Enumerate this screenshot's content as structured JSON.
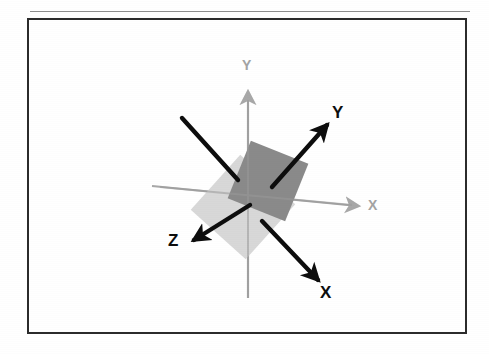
{
  "figure": {
    "kind": "technical-line-diagram",
    "caption": "",
    "background_color": "#ffffff",
    "frame": {
      "border_color": "#2b2b2b",
      "border_width_px": 2,
      "x": 27,
      "y": 18,
      "width": 440,
      "height": 316,
      "scan_rule_above": true
    },
    "origin": {
      "x": 248,
      "y": 205
    },
    "planes": [
      {
        "name": "original-plane",
        "fill_color": "#d8d8d8",
        "center_x": 243,
        "center_y": 207,
        "size": 74,
        "rotation_deg": 42
      },
      {
        "name": "rotated-plane",
        "fill_color": "#8a8a8a",
        "center_x": 268,
        "center_y": 181,
        "size": 62,
        "rotation_deg": 22
      }
    ],
    "axes_original": {
      "color": "#a8a8a8",
      "stroke_width": 2,
      "items": [
        {
          "name": "original-axis-y",
          "label": "Y",
          "direction": "up",
          "tip_x": 248,
          "tip_y": 92,
          "tail_x": 248,
          "tail_y": 298,
          "label_x": 243,
          "label_y": 62
        },
        {
          "name": "original-axis-x",
          "label": "X",
          "direction": "right",
          "tip_x": 360,
          "tip_y": 206,
          "tail_x": 152,
          "tail_y": 186,
          "label_x": 371,
          "label_y": 200
        }
      ]
    },
    "axes_rotated": {
      "color": "#0d0d0d",
      "stroke_width": 4,
      "items": [
        {
          "name": "rotated-axis-y",
          "label": "Y",
          "direction": "up-right",
          "tip_x": 331,
          "tip_y": 120,
          "tail_x": 272,
          "tail_y": 186,
          "label_x": 333,
          "label_y": 108
        },
        {
          "name": "rotated-axis-x",
          "label": "X",
          "direction": "down-right",
          "tip_x": 322,
          "tip_y": 285,
          "tail_x": 263,
          "tail_y": 222,
          "label_x": 321,
          "label_y": 289
        },
        {
          "name": "rotated-axis-z",
          "label": "Z",
          "direction": "down-left",
          "tip_x": 188,
          "tip_y": 243,
          "tail_x": 248,
          "tail_y": 205,
          "label_x": 170,
          "label_y": 237
        },
        {
          "name": "rotated-axis-z-negative",
          "label": "",
          "direction": "up-left",
          "tip_x": 182,
          "tip_y": 118,
          "tail_x": 236,
          "tail_y": 181,
          "label_x": 0,
          "label_y": 0
        }
      ]
    },
    "labels": {
      "rotated_x": "X",
      "rotated_y": "Y",
      "rotated_z": "Z",
      "original_x": "X",
      "original_y": "Y"
    }
  }
}
